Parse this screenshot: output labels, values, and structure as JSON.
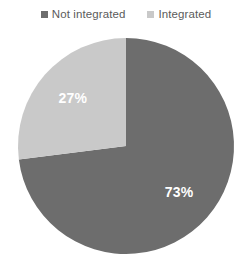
{
  "legend": {
    "position": "top",
    "items": [
      {
        "label": "Not integrated",
        "color": "#6d6d6d",
        "marker": "square-swatch-icon"
      },
      {
        "label": "Integrated",
        "color": "#c9c9c9",
        "marker": "square-swatch-icon"
      }
    ]
  },
  "labels": {
    "integrated": "27%",
    "not_integrated": "73%"
  },
  "chart_data": {
    "type": "pie",
    "title": "",
    "subtitle": "",
    "xlabel": "",
    "ylabel": "",
    "grid": false,
    "legend_position": "top",
    "start_angle_deg": 90,
    "direction": "clockwise",
    "categories": [
      "Not integrated",
      "Integrated"
    ],
    "values": [
      73,
      27
    ],
    "value_unit": "%",
    "data_labels": [
      "73%",
      "27%"
    ],
    "colors": [
      "#6d6d6d",
      "#c9c9c9"
    ],
    "data_label_color": "#ffffff",
    "background": "#ffffff"
  }
}
